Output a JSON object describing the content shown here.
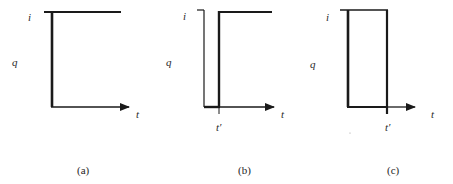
{
  "figure": {
    "panels": [
      {
        "id": "a",
        "caption": "(a)",
        "y_label_top": "i",
        "y_label_mid": "q",
        "x_label": "t",
        "description": "step up at t=0 to level i"
      },
      {
        "id": "b",
        "caption": "(b)",
        "y_label_top": "i",
        "y_label_mid": "q",
        "x_label": "t",
        "x_tick_label": "t′",
        "description": "zero until t′, then step up to level i"
      },
      {
        "id": "c",
        "caption": "(c)",
        "y_label_top": "i",
        "y_label_mid": "q",
        "x_label": "t",
        "x_tick_label": "t′",
        "description": "level i from 0 until t′, then drops to zero (rectangular pulse)"
      }
    ],
    "colors": {
      "line": "#1a1a1a",
      "background": "#ffffff"
    }
  }
}
